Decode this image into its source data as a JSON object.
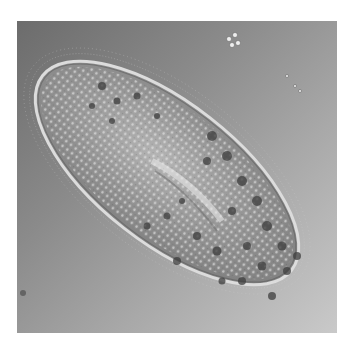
{
  "image": {
    "subject": "Paramecium (ciliate protozoan) under light microscopy",
    "style": "grayscale DIC micrograph",
    "background_color_dark": "#6c6c6c",
    "background_color_light": "#c9c9c9",
    "border_color": "#ffffff",
    "cell_fill": "#9a9a9a",
    "cell_rim": "#d8d8d8",
    "vacuole_color": "#3e3e3e"
  }
}
